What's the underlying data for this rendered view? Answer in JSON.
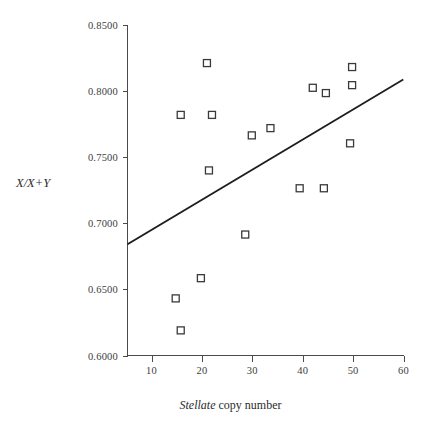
{
  "chart_data": {
    "type": "scatter",
    "title": "",
    "xlabel": "Stellate copy number",
    "xlabel_italic_part": "Stellate",
    "xlabel_roman_part": "copy number",
    "ylabel": "X/X+Y",
    "xlim": [
      5.2,
      60.6
    ],
    "ylim": [
      0.6,
      0.85
    ],
    "xticks": [
      10,
      20,
      30,
      40,
      50,
      60
    ],
    "xtick_labels": [
      "10",
      "20",
      "30",
      "40",
      "50",
      "60"
    ],
    "yticks": [
      0.6,
      0.65,
      0.7,
      0.75,
      0.8,
      0.85
    ],
    "ytick_labels": [
      "0.6000",
      "0.6500",
      "0.7000",
      "0.7500",
      "0.8000",
      "0.8500"
    ],
    "grid": false,
    "legend": null,
    "marker_style": "open-square",
    "series": [
      {
        "name": "observations",
        "points": [
          {
            "x": 15.8,
            "y": 0.782
          },
          {
            "x": 21.0,
            "y": 0.8212
          },
          {
            "x": 22.0,
            "y": 0.782
          },
          {
            "x": 21.4,
            "y": 0.74
          },
          {
            "x": 29.9,
            "y": 0.7665
          },
          {
            "x": 33.6,
            "y": 0.772
          },
          {
            "x": 39.4,
            "y": 0.7265
          },
          {
            "x": 44.2,
            "y": 0.7265
          },
          {
            "x": 42.0,
            "y": 0.8025
          },
          {
            "x": 44.6,
            "y": 0.7985
          },
          {
            "x": 49.8,
            "y": 0.8182
          },
          {
            "x": 49.8,
            "y": 0.8045
          },
          {
            "x": 49.4,
            "y": 0.7605
          },
          {
            "x": 28.6,
            "y": 0.6915
          },
          {
            "x": 19.8,
            "y": 0.6585
          },
          {
            "x": 14.8,
            "y": 0.6432
          },
          {
            "x": 15.8,
            "y": 0.619
          }
        ]
      }
    ],
    "trendline": {
      "name": "regression-line",
      "x_start": 5.4,
      "y_start": 0.6845,
      "x_end": 59.8,
      "y_end": 0.8085
    },
    "colors": {
      "marker_stroke": "#3a3a3a",
      "marker_fill": "#ffffff",
      "axis": "#4a4a4a",
      "trendline": "#1d1d1d",
      "text": "#2b2b2b",
      "background": "#ffffff"
    }
  }
}
